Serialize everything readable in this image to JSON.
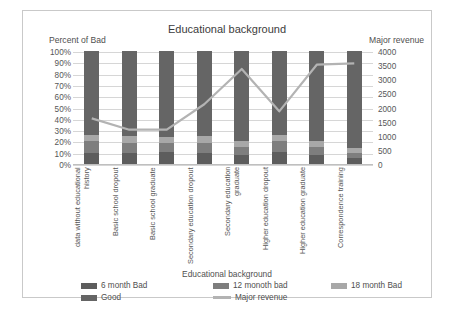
{
  "chart_data": {
    "type": "bar",
    "title": "Educational background",
    "subtitle": "",
    "xlabel": "Educational background",
    "ylabel": "Percent of Bad",
    "y2label": "Major revenue",
    "ylim": [
      0,
      100
    ],
    "y2lim": [
      0,
      4000
    ],
    "grid": true,
    "legend_position": "bottom",
    "stacked": true,
    "categories": [
      "data without educational history",
      "Basic school dropout",
      "Basic school graduate",
      "Secondary education dropout",
      "Secondary education graduate",
      "Higher education dropout",
      "Higher education graduate",
      "Correspondence training"
    ],
    "y_tick_labels": [
      "100%",
      "90%",
      "80%",
      "70%",
      "60%",
      "50%",
      "40%",
      "30%",
      "20%",
      "10%",
      "0%"
    ],
    "y_tick_values": [
      100,
      90,
      80,
      70,
      60,
      50,
      40,
      30,
      20,
      10,
      0
    ],
    "y2_tick_labels": [
      "4000",
      "3500",
      "3000",
      "2500",
      "2000",
      "1500",
      "1000",
      "500",
      "0"
    ],
    "y2_tick_values": [
      4000,
      3500,
      3000,
      2500,
      2000,
      1500,
      1000,
      500,
      0
    ],
    "series": [
      {
        "name": "6 month Bad",
        "kind": "bar",
        "color": "#5d5d5d",
        "values": [
          10,
          10,
          11,
          10,
          8,
          11,
          8,
          5
        ]
      },
      {
        "name": "12 monoth bad",
        "kind": "bar",
        "color": "#7e7e7e",
        "values": [
          10,
          9,
          8,
          9,
          7,
          9,
          7,
          5
        ]
      },
      {
        "name": "18 month Bad",
        "kind": "bar",
        "color": "#a8a8a8",
        "values": [
          6,
          6,
          5,
          6,
          5,
          6,
          5,
          4
        ]
      },
      {
        "name": "Good",
        "kind": "bar",
        "color": "#656565",
        "values": [
          74,
          75,
          76,
          75,
          80,
          74,
          80,
          86
        ]
      },
      {
        "name": "Major revenue",
        "kind": "line",
        "color": "#b3b3b3",
        "axis": "y2",
        "values": [
          1650,
          1250,
          1250,
          2150,
          3400,
          1900,
          3550,
          3600
        ]
      }
    ]
  },
  "axis_titles": {
    "left": "Percent of Bad",
    "right": "Major revenue"
  },
  "legend": {
    "title": "Educational background",
    "items": [
      {
        "label": "6 month Bad",
        "type": "swatch",
        "color": "#5d5d5d"
      },
      {
        "label": "12 monoth bad",
        "type": "swatch",
        "color": "#7e7e7e"
      },
      {
        "label": "18 month Bad",
        "type": "swatch",
        "color": "#a8a8a8"
      },
      {
        "label": "Good",
        "type": "swatch",
        "color": "#656565"
      },
      {
        "label": "Major revenue",
        "type": "line",
        "color": "#b3b3b3"
      }
    ]
  }
}
